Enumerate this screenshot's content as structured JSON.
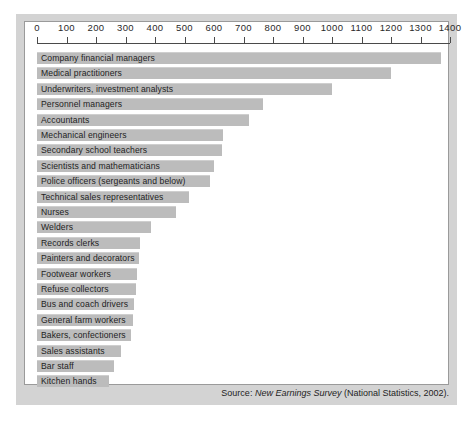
{
  "source_note": {
    "prefix": "Source: ",
    "title": "New Earnings Survey",
    "suffix": " (National Statistics, 2002)."
  },
  "chart_data": {
    "type": "bar",
    "orientation": "horizontal",
    "title": "",
    "xlabel": "",
    "ylabel": "",
    "xlim": [
      0,
      1400
    ],
    "xticks": [
      0,
      100,
      200,
      300,
      400,
      500,
      600,
      700,
      800,
      900,
      1000,
      1100,
      1200,
      1300,
      1400
    ],
    "xticklabels": [
      "0",
      "100",
      "200",
      "300",
      "400",
      "500",
      "600",
      "700",
      "800",
      "900",
      "1000",
      "1100",
      "1200",
      "1300",
      "1400"
    ],
    "grid": false,
    "legend": null,
    "bar_color": "#bcbcbc",
    "categories": [
      "Company financial managers",
      "Medical practitioners",
      "Underwriters, investment analysts",
      "Personnel managers",
      "Accountants",
      "Mechanical engineers",
      "Secondary school teachers",
      "Scientists and mathematicians",
      "Police officers (sergeants and below)",
      "Technical sales representatives",
      "Nurses",
      "Welders",
      "Records clerks",
      "Painters and decorators",
      "Footwear workers",
      "Refuse collectors",
      "Bus and coach drivers",
      "General farm workers",
      "Bakers, confectioners",
      "Sales assistants",
      "Bar staff",
      "Kitchen hands"
    ],
    "values": [
      1370,
      1200,
      1000,
      765,
      720,
      630,
      627,
      600,
      585,
      515,
      470,
      385,
      350,
      345,
      340,
      335,
      330,
      325,
      320,
      285,
      260,
      245
    ]
  }
}
